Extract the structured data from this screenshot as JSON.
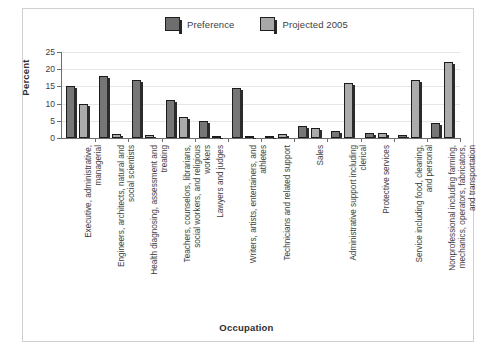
{
  "chart_data": {
    "type": "bar",
    "title": "",
    "xlabel": "Occupation",
    "ylabel": "Percent",
    "ylim": [
      0,
      25
    ],
    "yticks": [
      0,
      5,
      10,
      15,
      20,
      25
    ],
    "grid": true,
    "legend_position": "top-center",
    "categories": [
      "Executive, administrative, managerial",
      "Engineers, architects, natural and social scientists",
      "Health diagnosing, assessment and treating",
      "Teachers, counselors, librarians, social workers, and religious workers",
      "Lawyers and judges",
      "Writers, artists, entertainers, and athletes",
      "Technicians and related support",
      "Sales",
      "Administrative support including clerical",
      "Protective services",
      "Service including food, cleaning, and personal",
      "Nonprofessional including farming, mechanics, operators, fabricators, and transportation"
    ],
    "series": [
      {
        "name": "Preference",
        "color": "#767676",
        "values": [
          15.0,
          18.0,
          17.0,
          11.0,
          5.0,
          14.5,
          0.4,
          3.5,
          2.0,
          1.5,
          1.0,
          4.5
        ]
      },
      {
        "name": "Projected 2005",
        "color": "#ababab",
        "values": [
          10.0,
          1.2,
          1.0,
          6.0,
          0.5,
          0.5,
          1.2,
          3.0,
          16.0,
          1.5,
          17.0,
          22.0
        ]
      }
    ]
  },
  "legend": {
    "entries": [
      {
        "label": "Preference",
        "swatch": "dark"
      },
      {
        "label": "Projected 2005",
        "swatch": "light"
      }
    ]
  },
  "axes": {
    "y_title": "Percent",
    "x_title": "Occupation",
    "y_tick_labels": [
      "25",
      "20",
      "15",
      "10",
      "5",
      "0"
    ]
  }
}
